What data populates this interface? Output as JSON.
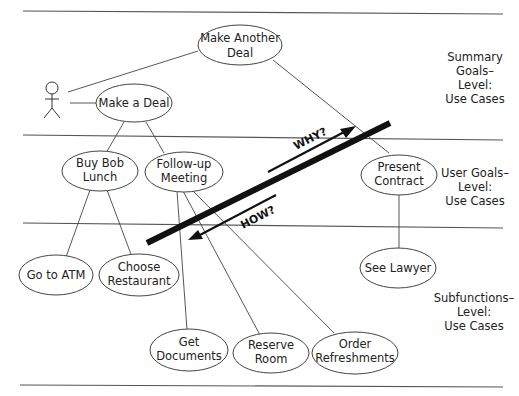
{
  "diagram": {
    "type": "use-case-goal-levels",
    "levels": [
      {
        "id": "summary",
        "lines": [
          "Summary",
          "Goals–",
          "Level:",
          "Use Cases"
        ]
      },
      {
        "id": "user",
        "lines": [
          "User Goals–",
          "Level:",
          "Use Cases"
        ]
      },
      {
        "id": "subfunction",
        "lines": [
          "Subfunctions–",
          "Level:",
          "Use Cases"
        ]
      }
    ],
    "actor": {
      "name": "actor",
      "label": ""
    },
    "use_cases": [
      {
        "id": "make_another_deal",
        "lines": [
          "Make Another",
          "Deal"
        ],
        "level": "summary"
      },
      {
        "id": "make_a_deal",
        "lines": [
          "Make a Deal"
        ],
        "level": "summary"
      },
      {
        "id": "buy_bob_lunch",
        "lines": [
          "Buy Bob",
          "Lunch"
        ],
        "level": "user"
      },
      {
        "id": "follow_up_meeting",
        "lines": [
          "Follow-up",
          "Meeting"
        ],
        "level": "user"
      },
      {
        "id": "present_contract",
        "lines": [
          "Present",
          "Contract"
        ],
        "level": "user"
      },
      {
        "id": "go_to_atm",
        "lines": [
          "Go to ATM"
        ],
        "level": "subfunction"
      },
      {
        "id": "choose_restaurant",
        "lines": [
          "Choose",
          "Restaurant"
        ],
        "level": "subfunction"
      },
      {
        "id": "see_lawyer",
        "lines": [
          "See Lawyer"
        ],
        "level": "subfunction"
      },
      {
        "id": "get_documents",
        "lines": [
          "Get",
          "Documents"
        ],
        "level": "subfunction"
      },
      {
        "id": "reserve_room",
        "lines": [
          "Reserve",
          "Room"
        ],
        "level": "subfunction"
      },
      {
        "id": "order_refreshments",
        "lines": [
          "Order",
          "Refreshments"
        ],
        "level": "subfunction"
      }
    ],
    "arrows": {
      "why": "WHY?",
      "how": "HOW?"
    }
  }
}
